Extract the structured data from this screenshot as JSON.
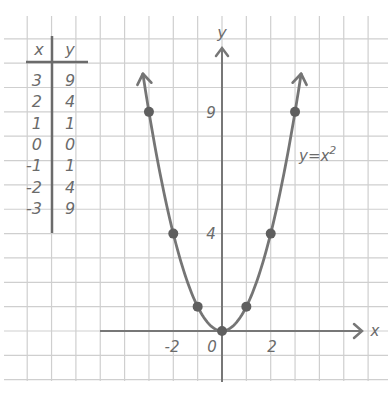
{
  "chart_data": {
    "type": "line",
    "title": "",
    "equation_label": "y = x²",
    "equation_base": "y=x",
    "equation_exp": "2",
    "xlabel": "x",
    "ylabel": "y",
    "x": [
      -3,
      -2,
      -1,
      0,
      1,
      2,
      3
    ],
    "series": [
      {
        "name": "y = x^2",
        "values": [
          9,
          4,
          1,
          0,
          1,
          4,
          9
        ]
      }
    ],
    "x_tick_labels": [
      "-2",
      "0",
      "2"
    ],
    "y_tick_labels": [
      "4",
      "9"
    ],
    "grid": true,
    "xlim": [
      -9,
      6
    ],
    "ylim": [
      -2,
      13
    ],
    "table": {
      "headers": [
        "x",
        "y"
      ],
      "rows": [
        [
          "3",
          "9"
        ],
        [
          "2",
          "4"
        ],
        [
          "1",
          "1"
        ],
        [
          "0",
          "0"
        ],
        [
          "-1",
          "1"
        ],
        [
          "-2",
          "4"
        ],
        [
          "-3",
          "9"
        ]
      ]
    }
  },
  "colors": {
    "grid": "#cfcfcf",
    "ink": "#6b6b6b",
    "curve": "#757575",
    "point": "#5f5f5f",
    "background": "#ffffff"
  }
}
